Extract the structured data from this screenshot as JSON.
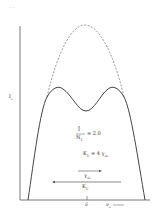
{
  "diagram": {
    "type": "line-profile-sketch",
    "corner_marks": ". .",
    "y_axis_label": "I",
    "y_axis_sub": "s",
    "x_axis_label": "ν",
    "x_axis_sub": "s",
    "x_axis_arrow": "→",
    "center_tick_label": "ν̄",
    "fraction_numerator": "Ī",
    "fraction_denominator": "N",
    "fraction_den_sub": "T",
    "ratio_value": "= 2.0",
    "ku_relation": "K",
    "ku_sub": "U",
    "ku_rhs": "= 4 γ",
    "ku_rhs_sub": "sb",
    "gamma_arrow_label": "γ",
    "gamma_arrow_sub": "sb",
    "ku_arrow_label": "K",
    "ku_arrow_sub": "U",
    "curves": [
      {
        "name": "dashed-envelope",
        "style": "dashed"
      },
      {
        "name": "solid-double-peak-profile",
        "style": "solid"
      }
    ]
  }
}
